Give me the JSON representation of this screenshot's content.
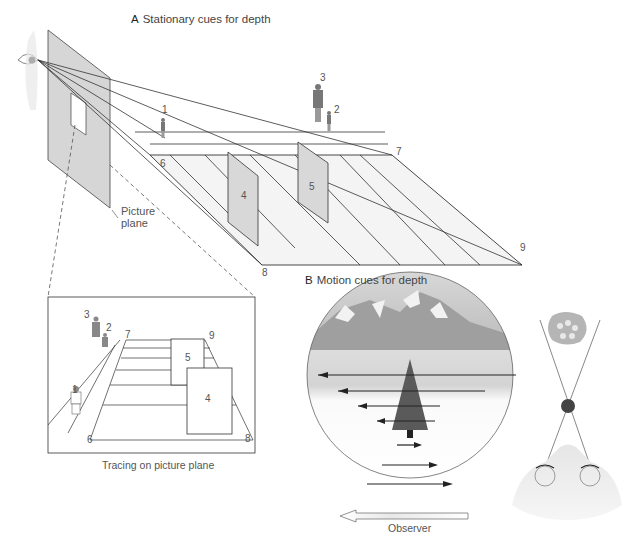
{
  "panel_a": {
    "letter": "A",
    "title": "Stationary cues for depth",
    "picture_plane_label_1": "Picture",
    "picture_plane_label_2": "plane",
    "markers": {
      "m1": "1",
      "m2": "2",
      "m3": "3",
      "m4": "4",
      "m5": "5",
      "m6": "6",
      "m7": "7",
      "m8": "8",
      "m9": "9"
    },
    "tracing": {
      "caption": "Tracing on picture plane",
      "markers": {
        "m1": "1",
        "m2": "2",
        "m3": "3",
        "m4": "4",
        "m5": "5",
        "m6": "6",
        "m7": "7",
        "m8": "8",
        "m9": "9"
      }
    }
  },
  "panel_b": {
    "letter": "B",
    "title": "Motion cues for depth",
    "observer_label": "Observer"
  },
  "colors": {
    "line": "#333333",
    "plane_fill": "#d6d6d6",
    "panel_fill": "#e4e4e4",
    "ground_fill": "#f3f3f3",
    "sky_gray": "#b8b8b8",
    "tree": "#555555"
  }
}
